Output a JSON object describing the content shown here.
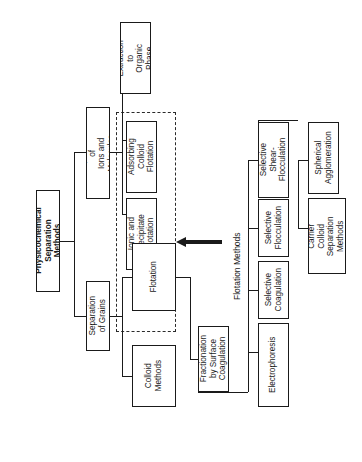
{
  "figure": {
    "orientation": "text rotated 90 degrees counter-clockwise",
    "line_color": "#1a1a1a",
    "background_color": "#ffffff"
  },
  "nodes": {
    "root": "Physicochemical\nSeparation Methods",
    "separation_of_ions_and_molecules": "Separation of\nIons and Molecules",
    "separation_of_grains": "Separation\nof Grains",
    "extraction_to_organic_phase": "Extraction\nto Organic\nPhase",
    "adsorbing_colloid_flotation": "Adsorbing\nColloid\nFlotation",
    "ionic_and_precipitate_flotation": "Ionic and\nPrecipitate\nFlotation",
    "flotation": "Flotation",
    "colloid_methods": "Colloid\nMethods",
    "fractionation_by_surface_coagulation": "Fractionation\nby Surface\nCoagulation",
    "selective_shear_flocculation": "Selective\nShear-Flocculation",
    "selective_flocculation": "Selective\nFlocculation",
    "selective_coagulation": "Selective\nCoagulation",
    "electrophoresis": "Electrophoresis",
    "spherical_agglomeration": "Spherical\nAgglomeration",
    "carrier_colloid_separation_methods": "Carrier Colloid\nSeparation\nMethods"
  },
  "annotations": {
    "flotation_methods_label": "Flotation Methods"
  }
}
